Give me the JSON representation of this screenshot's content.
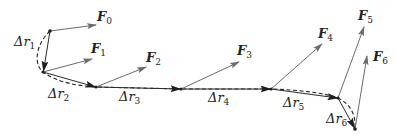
{
  "diagram": {
    "type": "work-along-curved-path",
    "colors": {
      "path": "#222222",
      "force": "#6b6b6b",
      "displacement": "#2a2a2a",
      "text": "#222222"
    },
    "points": [
      {
        "id": "P0",
        "x": 50,
        "y": 31
      },
      {
        "id": "P1",
        "x": 43,
        "y": 72
      },
      {
        "id": "P2",
        "x": 96,
        "y": 87
      },
      {
        "id": "P3",
        "x": 181,
        "y": 89
      },
      {
        "id": "P4",
        "x": 271,
        "y": 89
      },
      {
        "id": "P5",
        "x": 338,
        "y": 98
      },
      {
        "id": "P6",
        "x": 355,
        "y": 129
      }
    ],
    "forces": [
      {
        "symbol": "F",
        "sub": "0",
        "from": "P0",
        "to": [
          96,
          25
        ],
        "label_pos": [
          97,
          21
        ]
      },
      {
        "symbol": "F",
        "sub": "1",
        "from": "P1",
        "to": [
          92,
          59
        ],
        "label_pos": [
          91,
          53
        ]
      },
      {
        "symbol": "F",
        "sub": "2",
        "from": "P2",
        "to": [
          146,
          67
        ],
        "label_pos": [
          146,
          62
        ]
      },
      {
        "symbol": "F",
        "sub": "3",
        "from": "P3",
        "to": [
          239,
          62
        ],
        "label_pos": [
          237,
          55
        ]
      },
      {
        "symbol": "F",
        "sub": "4",
        "from": "P4",
        "to": [
          322,
          44
        ],
        "label_pos": [
          318,
          38
        ]
      },
      {
        "symbol": "F",
        "sub": "5",
        "from": "P5",
        "to": [
          364,
          27
        ],
        "label_pos": [
          358,
          20
        ]
      },
      {
        "symbol": "F",
        "sub": "6",
        "from": "P6",
        "to": [
          367,
          56
        ],
        "label_pos": [
          373,
          61
        ]
      }
    ],
    "displacements": [
      {
        "symbol": "Δr",
        "sub": "1",
        "label_pos": [
          14,
          46
        ]
      },
      {
        "symbol": "Δr",
        "sub": "2",
        "label_pos": [
          48,
          98
        ]
      },
      {
        "symbol": "Δr",
        "sub": "3",
        "label_pos": [
          119,
          101
        ]
      },
      {
        "symbol": "Δr",
        "sub": "4",
        "label_pos": [
          208,
          102
        ]
      },
      {
        "symbol": "Δr",
        "sub": "5",
        "label_pos": [
          283,
          107
        ]
      },
      {
        "symbol": "Δr",
        "sub": "6",
        "label_pos": [
          326,
          123
        ]
      }
    ],
    "labels": {
      "F0": "F",
      "F0_sub": "0",
      "F1": "F",
      "F1_sub": "1",
      "F2": "F",
      "F2_sub": "2",
      "F3": "F",
      "F3_sub": "3",
      "F4": "F",
      "F4_sub": "4",
      "F5": "F",
      "F5_sub": "5",
      "F6": "F",
      "F6_sub": "6",
      "dr1": "Δr",
      "dr1_sub": "1",
      "dr2": "Δr",
      "dr2_sub": "2",
      "dr3": "Δr",
      "dr3_sub": "3",
      "dr4": "Δr",
      "dr4_sub": "4",
      "dr5": "Δr",
      "dr5_sub": "5",
      "dr6": "Δr",
      "dr6_sub": "6"
    }
  }
}
